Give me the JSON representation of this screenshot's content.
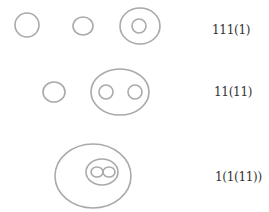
{
  "diagram": {
    "stroke_color": "#a9a9a9",
    "text_color": "#333333",
    "rows": [
      {
        "label": "111(1)",
        "shapes": [
          {
            "name": "circle-1",
            "cx": 27,
            "cy": 25,
            "rx": 12,
            "ry": 12
          },
          {
            "name": "circle-2",
            "cx": 83,
            "cy": 26,
            "rx": 10,
            "ry": 9
          },
          {
            "name": "circle-3-outer",
            "cx": 140,
            "cy": 26,
            "rx": 20,
            "ry": 18
          },
          {
            "name": "circle-3-inner",
            "cx": 139,
            "cy": 26,
            "rx": 7,
            "ry": 7
          }
        ]
      },
      {
        "label": "11(11)",
        "shapes": [
          {
            "name": "circle-1",
            "cx": 54,
            "cy": 92,
            "rx": 11,
            "ry": 10
          },
          {
            "name": "circle-2-outer",
            "cx": 120,
            "cy": 92,
            "rx": 29,
            "ry": 23
          },
          {
            "name": "circle-2-inner-left",
            "cx": 106,
            "cy": 92,
            "rx": 7,
            "ry": 7
          },
          {
            "name": "circle-2-inner-right",
            "cx": 135,
            "cy": 92,
            "rx": 7,
            "ry": 7
          }
        ]
      },
      {
        "label": "1(1(11))",
        "shapes": [
          {
            "name": "circle-outer",
            "cx": 93,
            "cy": 176,
            "rx": 38,
            "ry": 32
          },
          {
            "name": "circle-middle",
            "cx": 102,
            "cy": 172,
            "rx": 16,
            "ry": 13
          },
          {
            "name": "circle-inner-left",
            "cx": 97,
            "cy": 172,
            "rx": 6,
            "ry": 5
          },
          {
            "name": "circle-inner-right",
            "cx": 109,
            "cy": 172,
            "rx": 6,
            "ry": 5
          }
        ]
      }
    ]
  }
}
